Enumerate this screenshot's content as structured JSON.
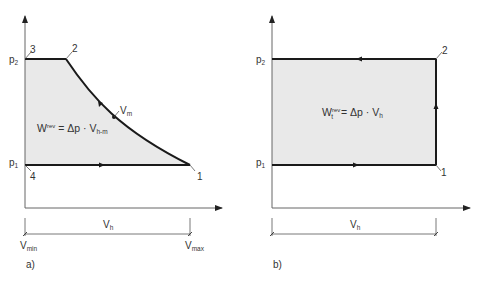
{
  "colors": {
    "fill": "#e9e9e9",
    "cycle_line": "#1a1a1a",
    "axis_line": "#555555",
    "text": "#333333"
  },
  "panel_a": {
    "label": "a)",
    "y_ticks": {
      "p2": {
        "base": "p",
        "sub": "2"
      },
      "p1": {
        "base": "p",
        "sub": "1"
      }
    },
    "points": {
      "p1": "1",
      "p2": "2",
      "p3": "3",
      "p4": "4"
    },
    "curve_point": {
      "base": "V",
      "sub": "m"
    },
    "formula": {
      "w": "W",
      "sup": "rev",
      "eq": " = Δp · V",
      "sub": "h-m"
    },
    "dimension": {
      "base": "V",
      "sub": "h"
    },
    "x_ticks": {
      "vmin": {
        "base": "V",
        "sub": "min"
      },
      "vmax": {
        "base": "V",
        "sub": "max"
      }
    }
  },
  "panel_b": {
    "label": "b)",
    "y_ticks": {
      "p2": {
        "base": "p",
        "sub": "2"
      },
      "p1": {
        "base": "p",
        "sub": "1"
      }
    },
    "points": {
      "p1": "1",
      "p2": "2"
    },
    "formula": {
      "w": "W",
      "sub_t": "t",
      "sup": "rev",
      "eq": " = Δp · V",
      "sub": "h"
    },
    "dimension": {
      "base": "V",
      "sub": "h"
    }
  }
}
